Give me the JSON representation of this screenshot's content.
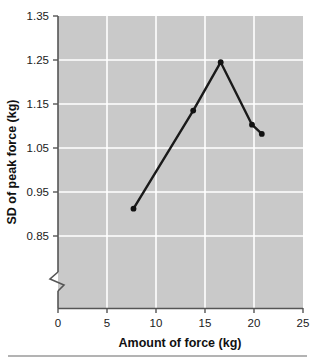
{
  "chart_data": {
    "type": "line",
    "title": "",
    "xlabel": "Amount of force (kg)",
    "ylabel": "SD of peak force (kg)",
    "x": [
      7.7,
      13.8,
      16.6,
      19.8,
      20.8
    ],
    "values": [
      0.912,
      1.135,
      1.245,
      1.103,
      1.082
    ],
    "series": [
      {
        "name": "SD of peak force",
        "x": [
          7.7,
          13.8,
          16.6,
          19.8,
          20.8
        ],
        "values": [
          0.912,
          1.135,
          1.245,
          1.103,
          1.082
        ]
      }
    ],
    "xlim": [
      0,
      25
    ],
    "ylim": [
      0.85,
      1.35
    ],
    "xticks": [
      0,
      5,
      10,
      15,
      20,
      25
    ],
    "yticks": [
      0.85,
      0.95,
      1.05,
      1.15,
      1.25,
      1.35
    ],
    "xtick_labels": [
      "0",
      "5",
      "10",
      "15",
      "20",
      "25"
    ],
    "ytick_labels": [
      "0.85",
      "0.95",
      "1.05",
      "1.15",
      "1.25",
      "1.35"
    ],
    "grid": true,
    "grid_color": "#ffffff",
    "plot_background": "#c9c9c9",
    "line_color": "#1a1a1a",
    "marker": "circle",
    "marker_color": "#111111",
    "legend": null,
    "y_axis_break": true,
    "axis_color": "#555555"
  },
  "axes": {
    "x_title": "Amount of force (kg)",
    "y_title": "SD of peak force (kg)"
  },
  "ticks": {
    "x": [
      "0",
      "5",
      "10",
      "15",
      "20",
      "25"
    ],
    "y": [
      "1.35",
      "1.25",
      "1.15",
      "1.05",
      "0.95",
      "0.85"
    ]
  },
  "footer": {
    "rule": ""
  }
}
